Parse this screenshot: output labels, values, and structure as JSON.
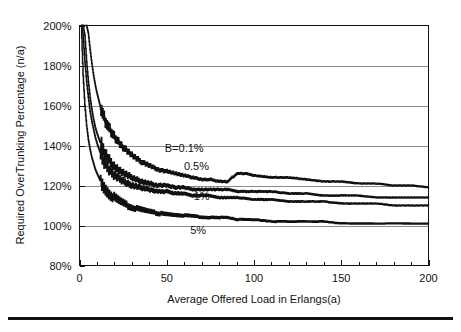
{
  "figure": {
    "background_color": "#ffffff",
    "ink_color": "#111111",
    "grid_color": "#8c8c8c",
    "footer_rule": true
  },
  "chart_data": {
    "type": "line",
    "title": "",
    "xlabel": "Average Offered Load in Erlangs(a)",
    "ylabel": "Required OverTrunking Percentage (n/a)",
    "xlim": [
      0,
      200
    ],
    "ylim": [
      80,
      200
    ],
    "xticks": [
      0,
      50,
      100,
      150,
      200
    ],
    "xtick_labels": [
      "0",
      "50",
      "100",
      "150",
      "200"
    ],
    "x_minor_tick_step": 10,
    "yticks": [
      80,
      100,
      120,
      140,
      160,
      180,
      200
    ],
    "ytick_labels": [
      "80%",
      "100%",
      "120%",
      "140%",
      "160%",
      "180%",
      "200%"
    ],
    "grid": "horizontal",
    "legend_position": "inline-labels",
    "y_unit": "percent",
    "series": [
      {
        "name": "B=0.1%",
        "label": "B=0.1%",
        "label_x": 60,
        "label_y": 137,
        "x": [
          1,
          2,
          3,
          4,
          5,
          6,
          7,
          8,
          9,
          10,
          12,
          14,
          16,
          18,
          20,
          25,
          30,
          35,
          40,
          45,
          50,
          55,
          60,
          65,
          70,
          75,
          80,
          85,
          90,
          95,
          100,
          110,
          120,
          130,
          140,
          150,
          160,
          170,
          180,
          190,
          200
        ],
        "y": [
          200,
          200,
          200,
          200,
          196,
          188,
          181,
          175,
          170,
          166,
          159,
          154,
          150,
          147,
          144,
          139,
          135,
          132,
          130,
          128,
          127,
          126,
          125,
          124,
          123,
          123,
          122,
          122,
          126,
          126,
          125,
          124,
          124,
          123,
          122,
          122,
          121,
          121,
          120,
          120,
          119
        ]
      },
      {
        "name": "0.5%",
        "label": "0.5%",
        "label_x": 67,
        "label_y": 128,
        "x": [
          1,
          2,
          3,
          4,
          5,
          6,
          7,
          8,
          9,
          10,
          12,
          14,
          16,
          18,
          20,
          25,
          30,
          35,
          40,
          45,
          50,
          55,
          60,
          65,
          70,
          75,
          80,
          85,
          90,
          100,
          110,
          120,
          130,
          140,
          150,
          160,
          170,
          180,
          190,
          200
        ],
        "y": [
          200,
          200,
          195,
          182,
          172,
          164,
          158,
          153,
          149,
          146,
          141,
          137,
          134,
          131,
          129,
          126,
          124,
          122,
          121,
          120,
          120,
          119,
          119,
          118,
          118,
          118,
          118,
          118,
          117,
          117,
          117,
          116,
          116,
          115,
          115,
          115,
          114,
          114,
          114,
          114
        ]
      },
      {
        "name": "1%",
        "label": "1%",
        "label_x": 70,
        "label_y": 113,
        "x": [
          1,
          2,
          3,
          4,
          5,
          6,
          7,
          8,
          9,
          10,
          12,
          14,
          16,
          18,
          20,
          25,
          30,
          35,
          40,
          45,
          50,
          55,
          60,
          65,
          70,
          75,
          80,
          85,
          90,
          100,
          110,
          120,
          130,
          140,
          150,
          160,
          170,
          180,
          190,
          200
        ],
        "y": [
          200,
          195,
          182,
          172,
          164,
          157,
          152,
          148,
          144,
          141,
          136,
          132,
          129,
          127,
          125,
          122,
          120,
          119,
          118,
          117,
          117,
          116,
          116,
          115,
          115,
          115,
          114,
          114,
          114,
          113,
          113,
          112,
          112,
          112,
          111,
          111,
          111,
          110,
          110,
          110
        ]
      },
      {
        "name": "5%",
        "label": "5%",
        "label_x": 68,
        "label_y": 96,
        "x": [
          1,
          2,
          3,
          4,
          5,
          6,
          7,
          8,
          9,
          10,
          12,
          14,
          16,
          18,
          20,
          25,
          30,
          35,
          40,
          45,
          50,
          55,
          60,
          65,
          70,
          75,
          80,
          85,
          90,
          100,
          110,
          120,
          130,
          140,
          150,
          160,
          170,
          180,
          190,
          200
        ],
        "y": [
          200,
          175,
          160,
          150,
          143,
          138,
          134,
          131,
          128,
          126,
          122,
          119,
          117,
          115,
          114,
          111,
          109,
          108,
          107,
          106,
          106,
          105,
          105,
          105,
          104,
          104,
          104,
          104,
          103,
          103,
          102,
          102,
          102,
          102,
          101,
          101,
          101,
          101,
          101,
          101
        ]
      }
    ]
  }
}
